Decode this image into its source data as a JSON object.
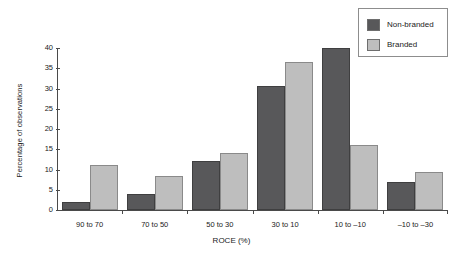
{
  "chart_data": {
    "type": "bar",
    "title": "",
    "xlabel": "ROCE (%)",
    "ylabel": "Percentage of observations",
    "categories": [
      "90 to 70",
      "70 to 50",
      "50 to 30",
      "30 to 10",
      "10 to –10",
      "–10 to –30"
    ],
    "series": [
      {
        "name": "Non-branded",
        "color": "#58585a",
        "values": [
          2,
          4,
          12,
          30.5,
          40,
          7
        ]
      },
      {
        "name": "Branded",
        "color": "#bebebe",
        "values": [
          11,
          8.5,
          14,
          36.5,
          16,
          9.5
        ]
      }
    ],
    "ylim": [
      0,
      40
    ],
    "yticks": [
      0,
      5,
      10,
      15,
      20,
      25,
      30,
      35,
      40
    ],
    "ytick_labels": [
      "0",
      "5",
      "10",
      "15",
      "20",
      "25",
      "30",
      "35",
      "40"
    ],
    "grid": false,
    "legend_position": "top-right"
  },
  "legend": {
    "entries": [
      {
        "label": "Non-branded",
        "swatch": "#58585a"
      },
      {
        "label": "Branded",
        "swatch": "#bebebe"
      }
    ]
  }
}
